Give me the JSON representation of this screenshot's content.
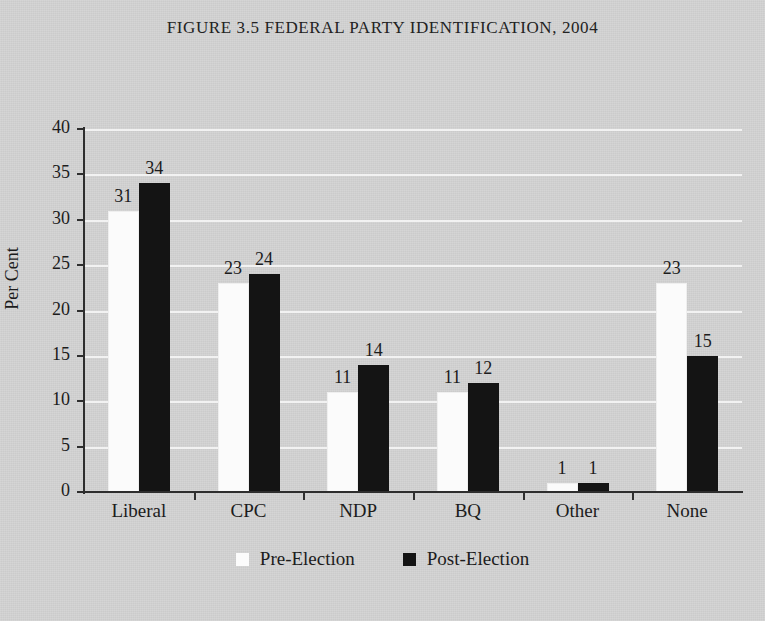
{
  "figure": {
    "title": "FIGURE 3.5 FEDERAL PARTY IDENTIFICATION, 2004"
  },
  "chart_data": {
    "type": "bar",
    "title": "FIGURE 3.5 FEDERAL PARTY IDENTIFICATION, 2004",
    "xlabel": "",
    "ylabel": "Per Cent",
    "categories": [
      "Liberal",
      "CPC",
      "NDP",
      "BQ",
      "Other",
      "None"
    ],
    "series": [
      {
        "name": "Pre-Election",
        "color": "#fbfbfb",
        "values": [
          31,
          23,
          11,
          11,
          1,
          23
        ]
      },
      {
        "name": "Post-Election",
        "color": "#141414",
        "values": [
          34,
          24,
          14,
          12,
          1,
          15
        ]
      }
    ],
    "ylim": [
      0,
      40
    ],
    "yticks": [
      0,
      5,
      10,
      15,
      20,
      25,
      30,
      35,
      40
    ],
    "ytick_labels": [
      "0",
      "5",
      "10",
      "15",
      "20",
      "25",
      "30",
      "35",
      "40"
    ],
    "grid": true,
    "grid_color": "#f4f4f4",
    "background_color": "#d3d3d3",
    "legend_position": "bottom",
    "data_labels": true
  }
}
